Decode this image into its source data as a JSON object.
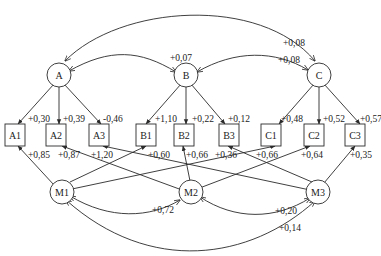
{
  "diagram": {
    "type": "structural equation / path diagram",
    "latent_factors": [
      {
        "id": "A",
        "label": "A"
      },
      {
        "id": "B",
        "label": "B"
      },
      {
        "id": "C",
        "label": "C"
      }
    ],
    "method_factors": [
      {
        "id": "M1",
        "label": "M1"
      },
      {
        "id": "M2",
        "label": "M2"
      },
      {
        "id": "M3",
        "label": "M3"
      }
    ],
    "indicators": [
      {
        "id": "A1",
        "label": "A1"
      },
      {
        "id": "A2",
        "label": "A2"
      },
      {
        "id": "A3",
        "label": "A3"
      },
      {
        "id": "B1",
        "label": "B1"
      },
      {
        "id": "B2",
        "label": "B2"
      },
      {
        "id": "B3",
        "label": "B3"
      },
      {
        "id": "C1",
        "label": "C1"
      },
      {
        "id": "C2",
        "label": "C2"
      },
      {
        "id": "C3",
        "label": "C3"
      }
    ],
    "trait_loadings": [
      {
        "from": "A",
        "to": "A1",
        "label": "+0,30"
      },
      {
        "from": "A",
        "to": "A2",
        "label": "+0,39"
      },
      {
        "from": "A",
        "to": "A3",
        "label": "-0,46"
      },
      {
        "from": "B",
        "to": "B1",
        "label": "+1,10"
      },
      {
        "from": "B",
        "to": "B2",
        "label": "+0,22"
      },
      {
        "from": "B",
        "to": "B3",
        "label": "+0,12"
      },
      {
        "from": "C",
        "to": "C1",
        "label": "+0,48"
      },
      {
        "from": "C",
        "to": "C2",
        "label": "+0,52"
      },
      {
        "from": "C",
        "to": "C3",
        "label": "+0,57"
      }
    ],
    "method_loadings": [
      {
        "from": "M1",
        "to": "A1",
        "label": "+0,85"
      },
      {
        "from": "M2",
        "to": "A2",
        "label": "+0,87"
      },
      {
        "from": "M3",
        "to": "A3",
        "label": "+1,20"
      },
      {
        "from": "M1",
        "to": "B1",
        "label": "+0,60"
      },
      {
        "from": "M2",
        "to": "B2",
        "label": "+0,66"
      },
      {
        "from": "M3",
        "to": "B3",
        "label": "+0,36"
      },
      {
        "from": "M1",
        "to": "C1",
        "label": "+0,66"
      },
      {
        "from": "M2",
        "to": "C2",
        "label": "+0,64"
      },
      {
        "from": "M3",
        "to": "C3",
        "label": "+0,35"
      }
    ],
    "trait_correlations": [
      {
        "between": [
          "A",
          "B"
        ],
        "label": "+0,07"
      },
      {
        "between": [
          "B",
          "C"
        ],
        "label": "+0,08"
      },
      {
        "between": [
          "A",
          "C"
        ],
        "label": "+0,08"
      }
    ],
    "method_correlations": [
      {
        "between": [
          "M1",
          "M2"
        ],
        "label": "+0,72"
      },
      {
        "between": [
          "M2",
          "M3"
        ],
        "label": "+0,20"
      },
      {
        "between": [
          "M1",
          "M3"
        ],
        "label": "+0,14"
      }
    ]
  }
}
